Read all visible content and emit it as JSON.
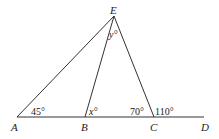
{
  "diagram": {
    "type": "geometry",
    "points": {
      "A": {
        "label": "A",
        "x": 17,
        "y": 117
      },
      "B": {
        "label": "B",
        "x": 85,
        "y": 117
      },
      "C": {
        "label": "C",
        "x": 154,
        "y": 117
      },
      "D": {
        "label": "D",
        "x": 204,
        "y": 117
      },
      "E": {
        "label": "E",
        "x": 114,
        "y": 16
      }
    },
    "segments": [
      "AD",
      "AE",
      "BE",
      "CE"
    ],
    "angles": {
      "at_A": "45°",
      "at_B": "x°",
      "at_C_interior": "70°",
      "at_C_exterior": "110°",
      "at_E": "y°"
    }
  }
}
